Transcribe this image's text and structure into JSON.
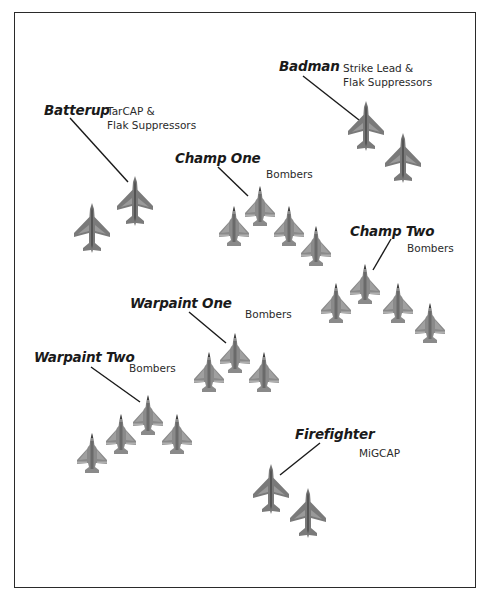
{
  "diagram": {
    "title_cutoff": "",
    "colors": {
      "aircraft_fill": "#7a7a7a",
      "aircraft_light": "#a8a8a8",
      "line": "#1a1a1a",
      "frame": "#2a2a2a"
    },
    "flights": [
      {
        "callsign": "Batterup",
        "role_lines": [
          "TarCAP &",
          "Flak Suppressors"
        ],
        "aircraft_type": "fighter",
        "count": 2
      },
      {
        "callsign": "Badman",
        "role_lines": [
          "Strike Lead &",
          "Flak Suppressors"
        ],
        "aircraft_type": "fighter",
        "count": 2
      },
      {
        "callsign": "Champ One",
        "role_lines": [
          "Bombers"
        ],
        "aircraft_type": "bomber",
        "count": 4
      },
      {
        "callsign": "Champ Two",
        "role_lines": [
          "Bombers"
        ],
        "aircraft_type": "bomber",
        "count": 4
      },
      {
        "callsign": "Warpaint One",
        "role_lines": [
          "Bombers"
        ],
        "aircraft_type": "bomber",
        "count": 3
      },
      {
        "callsign": "Warpaint Two",
        "role_lines": [
          "Bombers"
        ],
        "aircraft_type": "bomber",
        "count": 4
      },
      {
        "callsign": "Firefighter",
        "role_lines": [
          "MiGCAP"
        ],
        "aircraft_type": "fighter",
        "count": 2
      }
    ]
  }
}
